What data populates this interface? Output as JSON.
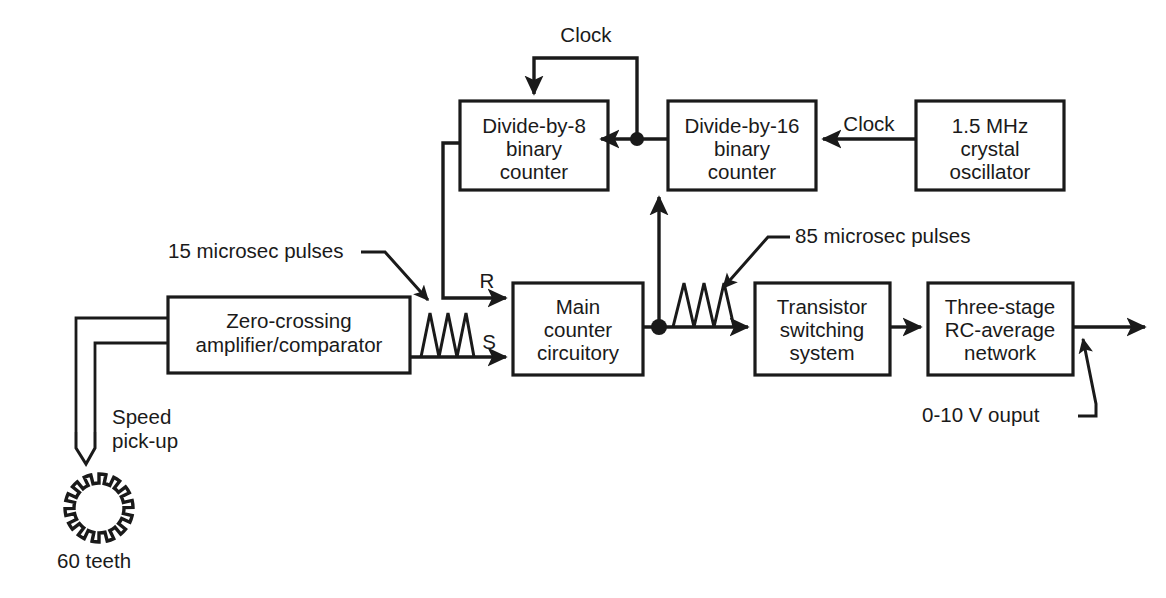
{
  "diagram": {
    "ink_color": "#1a1a1a",
    "background_color": "#ffffff",
    "blocks": [
      {
        "id": "divide-by-8",
        "lines": [
          "Divide-by-8",
          "binary",
          "counter"
        ]
      },
      {
        "id": "divide-by-16",
        "lines": [
          "Divide-by-16",
          "binary",
          "counter"
        ]
      },
      {
        "id": "crystal-oscillator",
        "lines": [
          "1.5 MHz",
          "crystal",
          "oscillator"
        ]
      },
      {
        "id": "zero-crossing-amplifier",
        "lines": [
          "Zero-crossing",
          "amplifier/comparator"
        ]
      },
      {
        "id": "main-counter",
        "lines": [
          "Main",
          "counter",
          "circuitory"
        ]
      },
      {
        "id": "transistor-switching",
        "lines": [
          "Transistor",
          "switching",
          "system"
        ]
      },
      {
        "id": "rc-average-network",
        "lines": [
          "Three-stage",
          "RC-average",
          "network"
        ]
      }
    ],
    "signal_labels": {
      "clock_feedback": "Clock",
      "clock_osc": "Clock",
      "reset_pin": "R",
      "set_pin": "S"
    },
    "annotations": {
      "pulses_15": "15 microsec pulses",
      "pulses_85": "85 microsec pulses",
      "output_voltage": "0-10 V ouput",
      "speed_pickup_line1": "Speed",
      "speed_pickup_line2": "pick-up",
      "gear_teeth": "60 teeth"
    }
  }
}
